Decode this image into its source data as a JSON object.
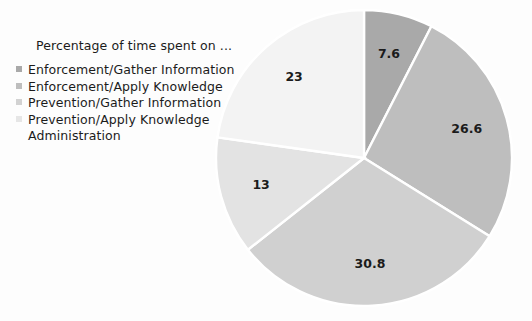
{
  "chart_data": {
    "type": "pie",
    "title": "Percentage of time spent on ...",
    "xlabel": "",
    "ylabel": "",
    "legend_position": "left",
    "grid": false,
    "categories": [
      "Enforcement/Gather Information",
      "Enforcement/Apply Knowledge",
      "Prevention/Gather Information",
      "Prevention/Apply Knowledge",
      "Administration"
    ],
    "values": [
      7.6,
      26.6,
      30.8,
      13,
      23
    ],
    "labels": [
      "7.6",
      "26.6",
      "30.8",
      "13",
      "23"
    ],
    "colors": [
      "#a9a9a9",
      "#bebebe",
      "#d0d0d0",
      "#e3e3e3",
      "#f3f3f3"
    ],
    "slice_order": "clockwise from 12 o'clock",
    "total": 101
  },
  "legend": {
    "title": "Percentage of time spent on ...",
    "items": [
      {
        "label": "Enforcement/Gather Information",
        "color": "#a9a9a9",
        "marker": true
      },
      {
        "label": "Enforcement/Apply Knowledge",
        "color": "#bebebe",
        "marker": true
      },
      {
        "label": "Prevention/Gather Information",
        "color": "#d2d2d2",
        "marker": true
      },
      {
        "label": "Prevention/Apply Knowledge",
        "color": "#e6e6e6",
        "marker": true
      },
      {
        "label": "Administration",
        "color": "#ffffff",
        "marker": false
      }
    ]
  },
  "pie": {
    "slices": [
      {
        "name": "enforcement-gather-information",
        "value": "7.6"
      },
      {
        "name": "enforcement-apply-knowledge",
        "value": "26.6"
      },
      {
        "name": "prevention-gather-information",
        "value": "30.8"
      },
      {
        "name": "prevention-apply-knowledge",
        "value": "13"
      },
      {
        "name": "administration",
        "value": "23"
      }
    ]
  }
}
